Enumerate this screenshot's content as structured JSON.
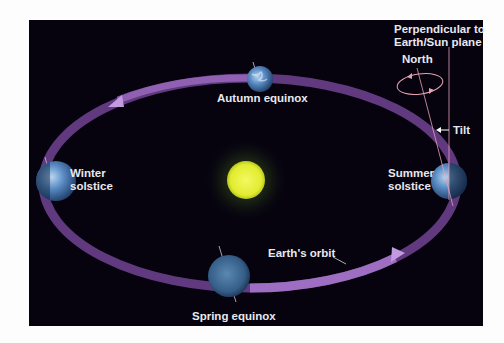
{
  "diagram": {
    "labels": {
      "autumn_equinox": "Autumn equinox",
      "winter_solstice_line1": "Winter",
      "winter_solstice_line2": "solstice",
      "summer_solstice_line1": "Summer",
      "summer_solstice_line2": "solstice",
      "spring_equinox": "Spring equinox",
      "earths_orbit": "Earth's orbit",
      "perpendicular_line1": "Perpendicular to",
      "perpendicular_line2": "Earth/Sun plane",
      "north": "North",
      "tilt": "Tilt"
    },
    "colors": {
      "background": "#06030f",
      "orbit": "#7a4a9a",
      "orbit_highlight": "#b58ad8",
      "sun": "#e8f040",
      "sun_glow": "#7fa030",
      "earth": "#4a80b8",
      "label": "#e8e8ee"
    },
    "nodes": [
      {
        "id": "sun",
        "label": ""
      },
      {
        "id": "earth-autumn",
        "label": "Autumn equinox"
      },
      {
        "id": "earth-winter",
        "label": "Winter solstice"
      },
      {
        "id": "earth-summer",
        "label": "Summer solstice"
      },
      {
        "id": "earth-spring",
        "label": "Spring equinox"
      }
    ]
  }
}
